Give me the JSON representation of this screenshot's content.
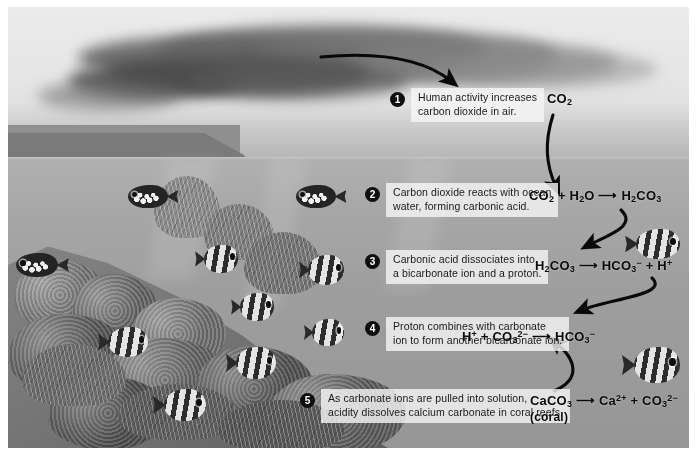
{
  "figure": {
    "palette": {
      "sky": "#e5e5e3",
      "sea": "#a2a2a0",
      "reef": "#6f6f6d",
      "callout_bg": "#f4f4f3",
      "badge_bg": "#111111",
      "text": "#1b1b1b",
      "arrow": "#0b0b0b"
    }
  },
  "scene": {
    "sky_label": "sky-with-smoke-plume",
    "city_label": "industrial-city-skyline",
    "ocean_label": "ocean-water",
    "reef_label": "coral-reef-seafloor"
  },
  "steps": [
    {
      "number": "1",
      "text": "Human activity increases\ncarbon dioxide in air.",
      "name": "step-1-human-activity"
    },
    {
      "number": "2",
      "text": "Carbon dioxide reacts with ocean\nwater, forming carbonic acid.",
      "name": "step-2-carbon-dioxide-reacts"
    },
    {
      "number": "3",
      "text": "Carbonic acid dissociates into\na bicarbonate ion and a proton.",
      "name": "step-3-carbonic-acid-dissociates"
    },
    {
      "number": "4",
      "text": "Proton combines with carbonate\nion to form another bicarbonate ion.",
      "name": "step-4-proton-combines"
    },
    {
      "number": "5",
      "text": "As carbonate ions are pulled into solution,\nacidity dissolves calcium carbonate in coral reefs.",
      "name": "step-5-acidity-dissolves-calcium-carbonate"
    }
  ],
  "equations": {
    "co2_label": "CO2",
    "eq1": {
      "plain": "CO2 + H2O → H2CO3",
      "parts": [
        "CO",
        "2",
        " + H",
        "2",
        "O",
        " → ",
        "H",
        "2",
        "CO",
        "3"
      ]
    },
    "eq2": {
      "plain": "H2CO3 → HCO3⁻ + H⁺"
    },
    "eq3": {
      "plain": "H⁺ + CO3²⁻ → HCO3⁻"
    },
    "eq4": {
      "plain": "CaCO3 → Ca²⁺ + CO3²⁻",
      "note": "(coral)"
    }
  },
  "arrows": [
    {
      "name": "arrow-smoke-to-co2",
      "from": "smoke plume",
      "to": "CO2"
    },
    {
      "name": "arrow-co2-to-eq1",
      "from": "CO2",
      "to": "CO2 + H2O → H2CO3"
    },
    {
      "name": "arrow-eq1-to-eq2",
      "from": "H2CO3 product",
      "to": "H2CO3 reactant"
    },
    {
      "name": "arrow-eq2-to-eq3",
      "from": "H⁺ product",
      "to": "H⁺ reactant"
    },
    {
      "name": "arrow-eq4-to-eq3",
      "from": "CO3²⁻ from coral",
      "to": "CO3²⁻ reactant"
    }
  ],
  "wildlife": [
    {
      "name": "fish-clown-triggerfish-upper",
      "kind": "spotted"
    },
    {
      "name": "fish-clown-triggerfish-left",
      "kind": "spotted"
    },
    {
      "name": "fish-clown-triggerfish-mid",
      "kind": "spotted"
    },
    {
      "name": "fish-angelfish-a",
      "kind": "striped"
    },
    {
      "name": "fish-angelfish-b",
      "kind": "striped"
    },
    {
      "name": "fish-angelfish-c",
      "kind": "striped"
    },
    {
      "name": "fish-angelfish-d",
      "kind": "striped"
    },
    {
      "name": "fish-angelfish-e",
      "kind": "striped"
    },
    {
      "name": "fish-angelfish-f",
      "kind": "striped"
    },
    {
      "name": "fish-angelfish-g",
      "kind": "striped"
    },
    {
      "name": "fish-angelfish-right-upper",
      "kind": "striped"
    },
    {
      "name": "fish-discus-right-lower",
      "kind": "striped"
    }
  ]
}
